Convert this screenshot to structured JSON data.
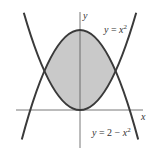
{
  "figure": {
    "axes": {
      "x_label": "x",
      "y_label": "y"
    },
    "curves": [
      {
        "name": "upper-parabola",
        "label_prefix": "y = ",
        "label_var": "x",
        "label_exp": "2",
        "equation": "y = x^2"
      },
      {
        "name": "lower-parabola",
        "label_prefix": "y = 2 − ",
        "label_var": "x",
        "label_exp": "2",
        "equation": "y = 2 - x^2"
      }
    ],
    "shaded_region": "area between y = x^2 and y = 2 - x^2, from x = -1 to x = 1",
    "intersections": [
      [
        -1,
        1
      ],
      [
        1,
        1
      ]
    ],
    "colors": {
      "curve": "#3a3a3a",
      "fill": "#c9c9c9",
      "axis": "#555555"
    }
  }
}
